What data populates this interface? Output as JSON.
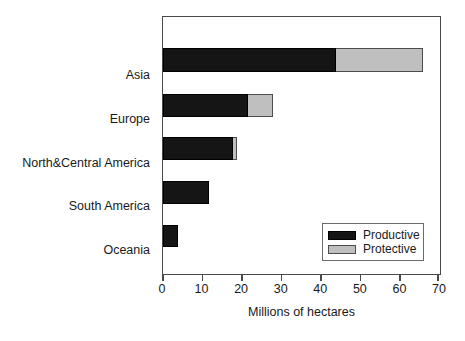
{
  "chart_data": {
    "type": "bar",
    "orientation": "horizontal",
    "stacked": true,
    "title": "",
    "xlabel": "Millions of hectares",
    "ylabel": "",
    "xlim": [
      0,
      70
    ],
    "xticks": [
      0,
      10,
      20,
      30,
      40,
      50,
      60,
      70
    ],
    "xtick_labels": [
      "0",
      "10",
      "20",
      "30",
      "40",
      "50",
      "60",
      "70"
    ],
    "grid": false,
    "legend_position": "lower right",
    "categories": [
      "Asia",
      "Europe",
      "North&Central America",
      "South America",
      "Oceania"
    ],
    "series": [
      {
        "name": "Productive",
        "color": "#151515",
        "values": [
          43.7,
          21.5,
          17.7,
          11.6,
          3.8
        ]
      },
      {
        "name": "Protective",
        "color": "#bfbfbf",
        "values": [
          21.9,
          6.3,
          1.0,
          0.0,
          0.0
        ]
      }
    ],
    "totals": [
      65.6,
      27.8,
      18.7,
      11.6,
      3.8
    ]
  },
  "axis": {
    "x_title": "Millions of hectares",
    "ticks": [
      {
        "value": 0,
        "label": "0"
      },
      {
        "value": 10,
        "label": "10"
      },
      {
        "value": 20,
        "label": "20"
      },
      {
        "value": 30,
        "label": "30"
      },
      {
        "value": 40,
        "label": "40"
      },
      {
        "value": 50,
        "label": "50"
      },
      {
        "value": 60,
        "label": "60"
      },
      {
        "value": 70,
        "label": "70"
      }
    ]
  },
  "categories": [
    {
      "label": "Asia"
    },
    {
      "label": "Europe"
    },
    {
      "label": "North&Central America"
    },
    {
      "label": "South America"
    },
    {
      "label": "Oceania"
    }
  ],
  "legend": {
    "entries": [
      {
        "label": "Productive",
        "color": "#151515"
      },
      {
        "label": "Protective",
        "color": "#bfbfbf"
      }
    ]
  },
  "colors": {
    "productive": "#151515",
    "protective": "#bfbfbf",
    "frame": "#4a4a4a",
    "background": "#ffffff",
    "text": "#1a1a1a"
  }
}
